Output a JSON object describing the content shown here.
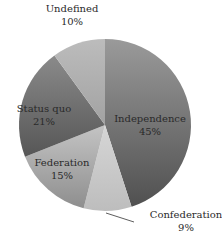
{
  "chart_data": {
    "type": "pie",
    "title": "",
    "start_angle_deg": 0,
    "direction": "clockwise",
    "center": [
      105,
      125
    ],
    "radius": 86,
    "slices": [
      {
        "label": "Independence",
        "value": 45,
        "pct_label": "45%",
        "color_a": "#9a9a9a",
        "color_b": "#505050",
        "label_pos": [
          150,
          122
        ]
      },
      {
        "label": "Confederation",
        "value": 9,
        "pct_label": "9%",
        "color_a": "#d6d6d6",
        "color_b": "#bdbdbd",
        "label_pos": [
          186,
          218
        ]
      },
      {
        "label": "Federation",
        "value": 15,
        "pct_label": "15%",
        "color_a": "#c4c4c4",
        "color_b": "#8e8e8e",
        "label_pos": [
          62,
          166
        ]
      },
      {
        "label": "Status quo",
        "value": 21,
        "pct_label": "21%",
        "color_a": "#8a8a8a",
        "color_b": "#565656",
        "label_pos": [
          44,
          112
        ]
      },
      {
        "label": "Undefined",
        "value": 10,
        "pct_label": "10%",
        "color_a": "#bcbcbc",
        "color_b": "#a2a2a2",
        "label_pos": [
          72,
          12
        ]
      }
    ],
    "leader_line": {
      "slice": "Confederation",
      "from": [
        106,
        213
      ],
      "to": [
        134,
        222
      ]
    },
    "legend": "none"
  }
}
